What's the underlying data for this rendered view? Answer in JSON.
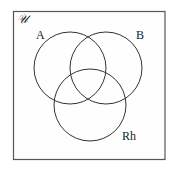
{
  "diagram": {
    "type": "venn",
    "universe_label": "𝒰",
    "sets": [
      {
        "label": "A"
      },
      {
        "label": "B"
      },
      {
        "label": "Rh"
      }
    ],
    "colors": {
      "background": "#ffffff",
      "stroke": "#333333",
      "frame": "#555555"
    }
  }
}
